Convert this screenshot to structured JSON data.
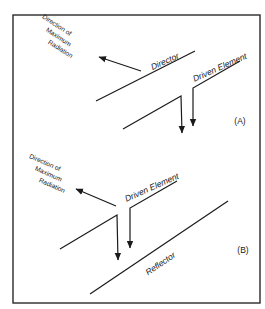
{
  "figure": {
    "colors": {
      "line": "#1a1a1a",
      "background": "#ffffff",
      "frame": "#2a2a2a"
    },
    "panels": [
      {
        "id": "A",
        "tag": "(A)",
        "parasitic_element_label": "Director",
        "driven_element_label": "Driven Element",
        "radiation_label_lines": [
          "Direction of",
          "Maximum",
          "Radiation"
        ]
      },
      {
        "id": "B",
        "tag": "(B)",
        "parasitic_element_label": "Reflector",
        "driven_element_label": "Driven Element",
        "radiation_label_lines": [
          "Direction of",
          "Maximum",
          "Radiation"
        ]
      }
    ]
  }
}
